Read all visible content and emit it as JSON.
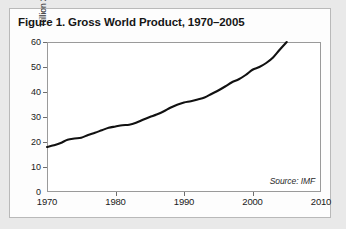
{
  "figure": {
    "title": "Figure 1. Gross World Product, 1970–2005",
    "source_note": "Source: IMF",
    "card_background": "#fdfdfd",
    "page_background": "#e9e9e9",
    "line_color": "#111111",
    "frame_color": "#9a9a9a"
  },
  "chart_data": {
    "type": "line",
    "title": "Figure 1. Gross World Product, 1970–2005",
    "xlabel": "",
    "ylabel": "Trillion 2005 Dollars",
    "xlim": [
      1970,
      2010
    ],
    "ylim": [
      0,
      60
    ],
    "grid": false,
    "legend": "none",
    "annotations": [
      "Source: IMF"
    ],
    "xticks": [
      1970,
      1980,
      1990,
      2000,
      2010
    ],
    "xticklabels": [
      "1970",
      "1980",
      "1990",
      "2000",
      "2010"
    ],
    "yticks": [
      0,
      10,
      20,
      30,
      40,
      50,
      60
    ],
    "yticklabels": [
      "0",
      "10",
      "20",
      "30",
      "40",
      "50",
      "60"
    ],
    "series": [
      {
        "name": "Gross World Product",
        "color": "#111111",
        "x": [
          1970,
          1971,
          1972,
          1973,
          1974,
          1975,
          1976,
          1977,
          1978,
          1979,
          1980,
          1981,
          1982,
          1983,
          1984,
          1985,
          1986,
          1987,
          1988,
          1989,
          1990,
          1991,
          1992,
          1993,
          1994,
          1995,
          1996,
          1997,
          1998,
          1999,
          2000,
          2001,
          2002,
          2003,
          2004,
          2005
        ],
        "values": [
          18.0,
          18.7,
          19.6,
          20.9,
          21.4,
          21.7,
          22.8,
          23.7,
          24.7,
          25.7,
          26.2,
          26.7,
          26.9,
          27.7,
          28.9,
          30.0,
          31.0,
          32.2,
          33.7,
          34.9,
          35.8,
          36.3,
          37.0,
          37.8,
          39.2,
          40.6,
          42.2,
          43.9,
          45.1,
          46.8,
          48.9,
          50.0,
          51.6,
          53.8,
          57.0,
          60.0
        ]
      }
    ]
  }
}
